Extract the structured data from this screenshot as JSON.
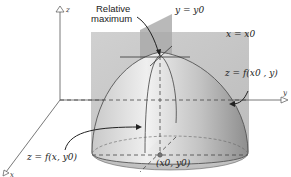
{
  "figure": {
    "labels": {
      "relative_maximum_line1": "Relative",
      "relative_maximum_line2": "maximum",
      "plane_y": "y = y0",
      "plane_x": "x = x0",
      "trace_x": "z = f(x0 , y)",
      "trace_y": "z = f(x, y0)",
      "point": "(x0, y0)"
    },
    "axes": {
      "z": "z",
      "y": "y",
      "x": "x"
    },
    "colors": {
      "surface_light": "#e8e8e8",
      "surface_dark": "#8a8a8a",
      "plane": "#b5b5b5",
      "line": "#444444"
    }
  }
}
